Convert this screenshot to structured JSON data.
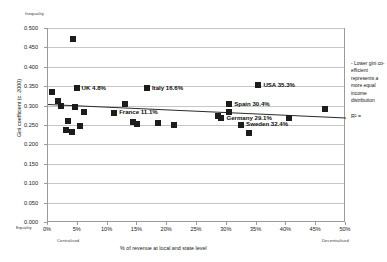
{
  "chart_data": {
    "type": "scatter",
    "title": "",
    "xlabel": "% of revenue at local and state level",
    "ylabel": "Gini coefficient (c. 2000)",
    "xlim": [
      0,
      50
    ],
    "ylim": [
      0,
      0.5
    ],
    "grid": true,
    "legend_position": "none",
    "x_tick_labels": [
      "0%",
      "5%",
      "10%",
      "15%",
      "20%",
      "25%",
      "30%",
      "35%",
      "40%",
      "45%",
      "50%"
    ],
    "x_tick_values": [
      0,
      5,
      10,
      15,
      20,
      25,
      30,
      35,
      40,
      45,
      50
    ],
    "y_tick_labels": [
      "0.000",
      "0.050",
      "0.100",
      "0.150",
      "0.200",
      "0.250",
      "0.300",
      "0.350",
      "0.400",
      "0.450",
      "0.500"
    ],
    "y_tick_values": [
      0.0,
      0.05,
      0.1,
      0.15,
      0.2,
      0.25,
      0.3,
      0.35,
      0.4,
      0.45,
      0.5
    ],
    "axis_end_labels": {
      "y_top": "Inequality",
      "y_bottom": "Equality",
      "x_left": "Centralised",
      "x_right": "Decentralised"
    },
    "points": [
      {
        "label": "",
        "x": 4.2,
        "y": 0.471
      },
      {
        "label": "",
        "x": 0.6,
        "y": 0.334
      },
      {
        "label": "UK 4.8%",
        "x": 4.8,
        "y": 0.345,
        "label_dx": 5,
        "label_dy": -0.5
      },
      {
        "label": "",
        "x": 1.6,
        "y": 0.312
      },
      {
        "label": "",
        "x": 2.1,
        "y": 0.3
      },
      {
        "label": "",
        "x": 4.5,
        "y": 0.296
      },
      {
        "label": "",
        "x": 6.0,
        "y": 0.283
      },
      {
        "label": "France 11.1%",
        "x": 11.1,
        "y": 0.281,
        "label_dx": 5,
        "label_dy": -0.5
      },
      {
        "label": "Italy 16.6%",
        "x": 16.6,
        "y": 0.345,
        "label_dx": 5,
        "label_dy": -0.5
      },
      {
        "label": "",
        "x": 13.0,
        "y": 0.305
      },
      {
        "label": "",
        "x": 14.3,
        "y": 0.259
      },
      {
        "label": "",
        "x": 15.0,
        "y": 0.253
      },
      {
        "label": "",
        "x": 18.5,
        "y": 0.256
      },
      {
        "label": "",
        "x": 21.2,
        "y": 0.249
      },
      {
        "label": "",
        "x": 3.4,
        "y": 0.26
      },
      {
        "label": "",
        "x": 3.0,
        "y": 0.238
      },
      {
        "label": "",
        "x": 4.0,
        "y": 0.231
      },
      {
        "label": "",
        "x": 5.3,
        "y": 0.247
      },
      {
        "label": "USA 35.3%",
        "x": 35.3,
        "y": 0.353,
        "label_dx": 5,
        "label_dy": -0.5
      },
      {
        "label": "Spain 30.4%",
        "x": 30.4,
        "y": 0.304,
        "label_dx": 5,
        "label_dy": -0.5
      },
      {
        "label": "",
        "x": 30.3,
        "y": 0.283
      },
      {
        "label": "Germany 29.1%",
        "x": 29.1,
        "y": 0.268,
        "label_dx": 5,
        "label_dy": -0.5
      },
      {
        "label": "",
        "x": 28.6,
        "y": 0.272
      },
      {
        "label": "Sweden 32.4%",
        "x": 32.4,
        "y": 0.251,
        "label_dx": 5,
        "label_dy": -0.5
      },
      {
        "label": "",
        "x": 33.7,
        "y": 0.23
      },
      {
        "label": "",
        "x": 40.5,
        "y": 0.268
      },
      {
        "label": "",
        "x": 46.5,
        "y": 0.29
      }
    ],
    "trendline": {
      "x0": 0,
      "y0": 0.303,
      "x1": 50,
      "y1": 0.268
    }
  },
  "annotation": {
    "note": "- Lower gini co-efficient represents a more equal income distribution",
    "r_squared_label": "R² ="
  }
}
